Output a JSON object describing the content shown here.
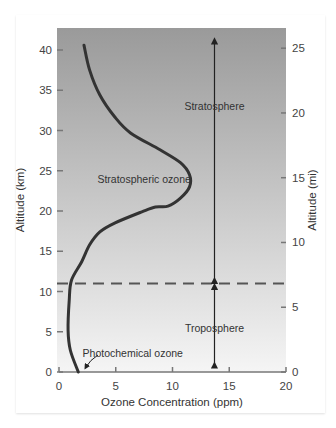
{
  "chart_data": {
    "type": "line",
    "title": "",
    "xlabel": "Ozone Concentration (ppm)",
    "ylabel": "Altitude (km)",
    "y2label": "Altitude (mi)",
    "xlim": [
      0,
      20
    ],
    "ylim": [
      0,
      43
    ],
    "y2lim": [
      0,
      26.7
    ],
    "xticks": [
      0,
      5,
      10,
      15,
      20
    ],
    "yticks": [
      0,
      5,
      10,
      15,
      20,
      25,
      30,
      35,
      40
    ],
    "y2ticks": [
      0,
      5,
      10,
      15,
      20,
      25
    ],
    "grid": false,
    "series": [
      {
        "name": "Ozone concentration profile",
        "x": [
          2.2,
          2.7,
          3.6,
          4.9,
          6.3,
          8.9,
          10.7,
          11.5,
          11.5,
          10.7,
          9.6,
          8.5,
          7.3,
          4.9,
          3.6,
          2.7,
          2.0,
          1.1,
          0.9,
          0.8,
          1.0,
          1.7
        ],
        "y": [
          40.6,
          37.5,
          34.4,
          31.7,
          29.7,
          27.6,
          26.0,
          24.5,
          23.0,
          21.6,
          20.6,
          20.5,
          19.9,
          18.5,
          17.4,
          15.8,
          13.7,
          11.4,
          8.9,
          5.2,
          2.7,
          0.0
        ]
      }
    ],
    "tropopause_km": 11,
    "annotations": [
      {
        "text": "Stratosphere",
        "x": 13.7,
        "y": 33
      },
      {
        "text": "Stratospheric ozone",
        "x": 7.5,
        "y": 24
      },
      {
        "text": "Troposphere",
        "x": 13.7,
        "y": 5.5
      },
      {
        "text": "Photochemical ozone",
        "x": 6.5,
        "y": 2.3
      }
    ],
    "layer_arrows": [
      {
        "label": "Stratosphere",
        "x": 13.7,
        "from_km": 11,
        "to_km": 41.5
      },
      {
        "label": "Troposphere",
        "x": 13.7,
        "from_km": 0.5,
        "to_km": 11
      }
    ],
    "colors": {
      "curve": "#333333",
      "dashed_line": "#555555",
      "bg_top": "#9a9a9a",
      "bg_bottom": "#f5f5f5"
    }
  }
}
